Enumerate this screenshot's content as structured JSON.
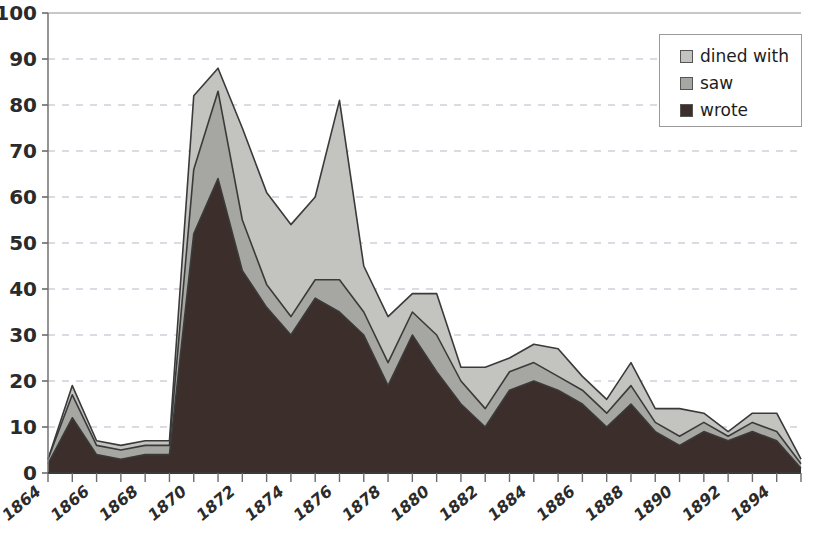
{
  "chart_data": {
    "type": "area",
    "stacked": true,
    "title": "",
    "xlabel": "",
    "ylabel": "",
    "ylim": [
      0,
      100
    ],
    "ytick_step": 10,
    "yticks": [
      0,
      10,
      20,
      30,
      40,
      50,
      60,
      70,
      80,
      90,
      100
    ],
    "grid": true,
    "grid_style": "dashed-horizontal",
    "legend_position": "top-right",
    "x": [
      1864,
      1865,
      1866,
      1867,
      1868,
      1869,
      1870,
      1871,
      1872,
      1873,
      1874,
      1875,
      1876,
      1877,
      1878,
      1879,
      1880,
      1881,
      1882,
      1883,
      1884,
      1885,
      1886,
      1887,
      1888,
      1889,
      1890,
      1891,
      1892,
      1893,
      1894,
      1895
    ],
    "xtick_labels": [
      "1864",
      "1866",
      "1868",
      "1870",
      "1872",
      "1874",
      "1876",
      "1878",
      "1880",
      "1882",
      "1884",
      "1886",
      "1888",
      "1890",
      "1892",
      "1894"
    ],
    "xtick_step": 2,
    "series": [
      {
        "name": "wrote",
        "color": "#3b2e2b",
        "values": [
          2,
          12,
          4,
          3,
          4,
          4,
          52,
          64,
          44,
          36,
          30,
          38,
          35,
          30,
          19,
          30,
          22,
          15,
          10,
          18,
          20,
          18,
          15,
          10,
          15,
          9,
          6,
          9,
          7,
          9,
          7,
          1
        ]
      },
      {
        "name": "saw",
        "color": "#a6a6a2",
        "values": [
          1,
          5,
          2,
          2,
          2,
          2,
          14,
          19,
          11,
          5,
          4,
          4,
          7,
          5,
          5,
          5,
          8,
          5,
          4,
          4,
          4,
          3,
          3,
          3,
          4,
          2,
          2,
          2,
          1,
          2,
          2,
          1
        ]
      },
      {
        "name": "dined with",
        "color": "#c3c3c0",
        "values": [
          0,
          2,
          1,
          1,
          1,
          1,
          16,
          5,
          20,
          20,
          20,
          18,
          39,
          10,
          10,
          4,
          9,
          3,
          9,
          3,
          4,
          6,
          3,
          3,
          5,
          3,
          6,
          2,
          1,
          2,
          4,
          1
        ]
      }
    ],
    "totals": [
      3,
      19,
      7,
      6,
      7,
      7,
      82,
      88,
      75,
      61,
      54,
      60,
      81,
      45,
      34,
      39,
      39,
      23,
      23,
      25,
      28,
      27,
      21,
      16,
      24,
      14,
      14,
      13,
      9,
      13,
      13,
      3
    ]
  },
  "legend": {
    "items": [
      {
        "label": "dined with",
        "color": "#c3c3c0"
      },
      {
        "label": "saw",
        "color": "#a6a6a2"
      },
      {
        "label": "wrote",
        "color": "#3b2e2b"
      }
    ]
  },
  "axes": {
    "y_labels": [
      "100",
      "90",
      "80",
      "70",
      "60",
      "50",
      "40",
      "30",
      "20",
      "10",
      "0"
    ],
    "x_labels": [
      "1864",
      "1866",
      "1868",
      "1870",
      "1872",
      "1874",
      "1876",
      "1878",
      "1880",
      "1882",
      "1884",
      "1886",
      "1888",
      "1890",
      "1892",
      "1894"
    ]
  },
  "colors": {
    "axis": "#6b6b6b",
    "grid": "#b8b8c8",
    "outline": "#3a3a3a",
    "text": "#2b2b2b"
  }
}
